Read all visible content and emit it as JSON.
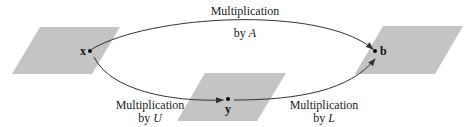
{
  "diagram": {
    "planes": [
      {
        "name": "plane-x",
        "points": "12,74 40,27 120,27 92,74"
      },
      {
        "name": "plane-y",
        "points": "177,121 205,73 286,73 257,121"
      },
      {
        "name": "plane-b",
        "points": "355,74 383,26 463,26 435,74"
      }
    ],
    "colors": {
      "plane": "#c4c4c4",
      "arrow": "#333333",
      "text": "#222222"
    },
    "points": {
      "x": "x",
      "y": "y",
      "b": "b"
    },
    "labels": {
      "top_line1": "Multiplication",
      "top_line2_prefix": "by ",
      "top_line2_var": "A",
      "left_line1": "Multiplication",
      "left_line2_prefix": "by ",
      "left_line2_var": "U",
      "right_line1": "Multiplication",
      "right_line2_prefix": "by ",
      "right_line2_var": "L"
    }
  }
}
